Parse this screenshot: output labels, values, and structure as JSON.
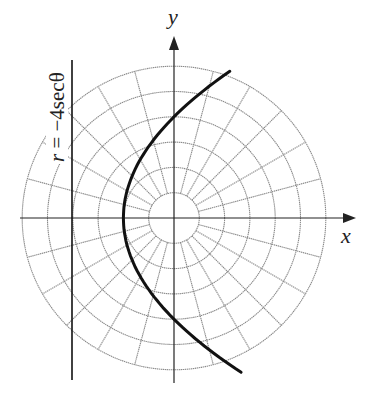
{
  "top_fragment": {
    "left_text": "ep  ...  y",
    "right_text": "..."
  },
  "axes": {
    "x_label": "x",
    "y_label": "y"
  },
  "equation_label": {
    "r": "r",
    "rest": " = −4secθ"
  },
  "colors": {
    "grid": "#8a8a8a",
    "axis": "#222222",
    "curve": "#111111",
    "background": "#ffffff"
  },
  "chart_data": {
    "type": "polar-diagram",
    "title": "",
    "grid": {
      "ring_radii": [
        1,
        2,
        3,
        4,
        5,
        6
      ],
      "spoke_angle_step_deg": 15,
      "spokes_start_radius": 1
    },
    "axes": {
      "x_label": "x",
      "y_label": "y",
      "origin": [
        0,
        0
      ]
    },
    "directrix": {
      "equation": "r = −4secθ",
      "cartesian": "x = −4",
      "y_range": [
        -6.4,
        6.3
      ]
    },
    "curve": {
      "description": "parabola opening right, focus at origin, directrix x = -4",
      "polar": "r = 4/(1 − cosθ)",
      "cartesian": "y^2 = 8(x + 2)",
      "vertex": [
        -2,
        0
      ],
      "y_intercepts": [
        [
          0,
          4
        ],
        [
          0,
          -4
        ]
      ],
      "endpoints": [
        [
          2.1,
          5.8
        ],
        [
          2.1,
          -6.1
        ]
      ]
    },
    "scale_px_per_unit": 25.3,
    "center_px": [
      174,
      218
    ]
  }
}
